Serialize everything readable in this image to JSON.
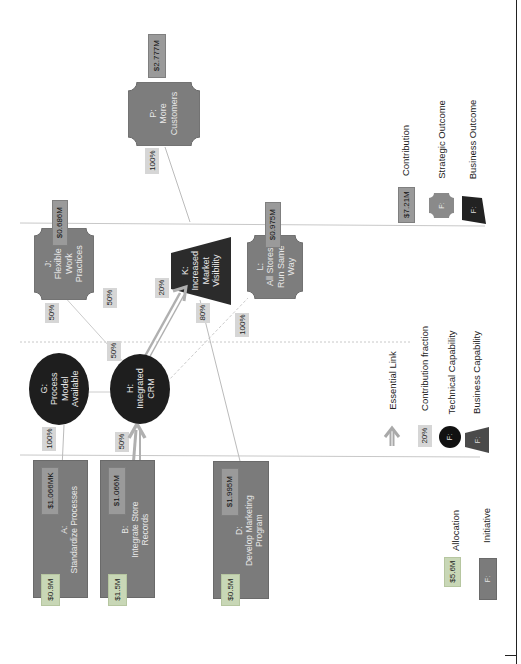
{
  "diagram": {
    "orientation": "rotated-90-ccw",
    "initiatives": [
      {
        "id": "A",
        "label": "A:",
        "name": "Standardize Processes",
        "allocation": "$0.9M",
        "contribution": "$1.066MK"
      },
      {
        "id": "B",
        "label": "B:",
        "name": "Integrate Store Records",
        "allocation": "$1.5M",
        "contribution": "$1.066M"
      },
      {
        "id": "D",
        "label": "D:",
        "name": "Develop Marketing Program",
        "allocation": "$0.5M",
        "contribution": "$1.995M"
      }
    ],
    "technical_capabilities": [
      {
        "id": "G",
        "label": "G:",
        "name": "Process Model Available"
      },
      {
        "id": "H",
        "label": "H:",
        "name": "Integrated CRM"
      }
    ],
    "business_capabilities": [
      {
        "id": "J",
        "label": "J:",
        "name": "Flexible Work Practices",
        "contribution": "$0.686M",
        "kind": "strategic"
      },
      {
        "id": "K",
        "label": "K:",
        "name": "Increased Market Visibility",
        "kind": "business"
      },
      {
        "id": "L",
        "label": "L:",
        "name": "All Stores Run Same Way",
        "contribution": "$0.975M",
        "kind": "strategic"
      }
    ],
    "outcomes": [
      {
        "id": "P",
        "label": "P:",
        "name": "More Customers",
        "contribution": "$2.777M"
      }
    ],
    "links": [
      {
        "from": "A",
        "to": "G",
        "fraction": "100%",
        "essential": false
      },
      {
        "from": "B",
        "to": "H",
        "fraction": "50%",
        "essential": true
      },
      {
        "from": "G",
        "to": "H",
        "fraction": "50%",
        "essential": false
      },
      {
        "from": "H",
        "to": "J",
        "fraction": "50%",
        "essential": false
      },
      {
        "from": "H",
        "to": "K",
        "fraction": "20%",
        "essential": true
      },
      {
        "from": "H",
        "to": "L",
        "fraction": "100%",
        "essential": false
      },
      {
        "from": "D",
        "to": "K",
        "fraction": "80%",
        "essential": false
      },
      {
        "from": "K",
        "to": "P",
        "fraction": "100%",
        "essential": false
      },
      {
        "from": "J",
        "to": "?",
        "fraction": "50%",
        "essential": false
      }
    ],
    "legend": {
      "allocation": {
        "sample": "$5.6M",
        "label": "Allocation"
      },
      "initiative": {
        "sample": "F:",
        "label": "Initiative"
      },
      "essential_link": {
        "label": "Essential Link"
      },
      "contribution_fraction": {
        "sample": "20%",
        "label": "Contribution fraction"
      },
      "technical_capability": {
        "sample": "F:",
        "label": "Technical Capability"
      },
      "business_capability": {
        "sample": "F:",
        "label": "Business Capability"
      },
      "contribution": {
        "sample": "$7.21M",
        "label": "Contribution"
      },
      "strategic_outcome": {
        "sample": "F:",
        "label": "Strategic Outcome"
      },
      "business_outcome": {
        "sample": "F:",
        "label": "Business Outcome"
      }
    },
    "colors": {
      "initiative": "#7b7b7b",
      "technical_capability": "#1e1e1e",
      "business_capability": "#2b2b2b",
      "strategic_outcome": "#7d7d7d",
      "allocation_tag": "#c8d7b6",
      "contribution_tag": "#9a9a9a",
      "fraction_tag": "#d6d6d6",
      "essential_link": "#a9a9a9"
    }
  }
}
